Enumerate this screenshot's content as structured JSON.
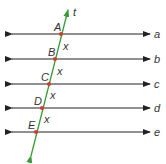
{
  "diagram": {
    "parallel_lines": [
      {
        "label": "a",
        "y": 34
      },
      {
        "label": "b",
        "y": 59
      },
      {
        "label": "c",
        "y": 84
      },
      {
        "label": "d",
        "y": 108
      },
      {
        "label": "e",
        "y": 132
      }
    ],
    "transversal": {
      "label": "t",
      "color": "#3a9a3a"
    },
    "points": [
      {
        "label": "A",
        "x": 61,
        "y": 34
      },
      {
        "label": "B",
        "x": 55,
        "y": 59
      },
      {
        "label": "C",
        "x": 49,
        "y": 84
      },
      {
        "label": "D",
        "x": 42,
        "y": 108
      },
      {
        "label": "E",
        "x": 36,
        "y": 132
      }
    ],
    "segment_labels": [
      "x",
      "x",
      "x",
      "x"
    ],
    "point_color": "#d9382a",
    "line_color": "#222222"
  }
}
